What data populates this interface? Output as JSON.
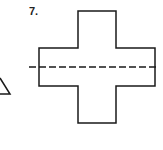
{
  "problem": {
    "number_label": "7."
  },
  "figure": {
    "shape": "cross",
    "stroke_color": "#1a1a1a",
    "fill_color": "#ffffff",
    "cross_outline_points": "78,11 116,11 116,48 155,48 155,86 116,86 116,123 78,123 78,86 39,86 39,48 78,48",
    "dashed_line": {
      "x1": 29,
      "y1": 67,
      "x2": 158,
      "y2": 67,
      "description": "line of symmetry"
    }
  },
  "partial_neighbor_figure": {
    "shape": "triangle-fragment",
    "points": "0,78 10,94 0,94"
  }
}
